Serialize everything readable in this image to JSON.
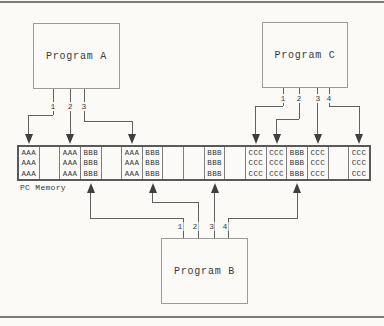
{
  "figure": {
    "background": "#fbfaf7",
    "line_color": "#616161",
    "box_border_color": "#9b9b99",
    "memory_border_color": "#59595b",
    "text_color": "#3a3a3a"
  },
  "programs": {
    "a": {
      "label": "Program A"
    },
    "b": {
      "label": "Program B"
    },
    "c": {
      "label": "Program C"
    }
  },
  "memory": {
    "label": "PC Memory",
    "rows_per_cell": 3,
    "cells": [
      "AAA",
      "",
      "AAA",
      "BBB",
      "",
      "AAA",
      "BBB",
      "",
      "",
      "BBB",
      "",
      "CCC",
      "CCC",
      "BBB",
      "CCC",
      "",
      "CCC"
    ]
  },
  "connections": {
    "a": [
      {
        "tap": "1",
        "cell": 1
      },
      {
        "tap": "2",
        "cell": 3
      },
      {
        "tap": "3",
        "cell": 6
      }
    ],
    "c": [
      {
        "tap": "1",
        "cell": 12
      },
      {
        "tap": "2",
        "cell": 13
      },
      {
        "tap": "3",
        "cell": 15
      },
      {
        "tap": "4",
        "cell": 17
      }
    ],
    "b": [
      {
        "tap": "1",
        "cell": 4
      },
      {
        "tap": "2",
        "cell": 7
      },
      {
        "tap": "3",
        "cell": 10
      },
      {
        "tap": "4",
        "cell": 14
      }
    ]
  }
}
